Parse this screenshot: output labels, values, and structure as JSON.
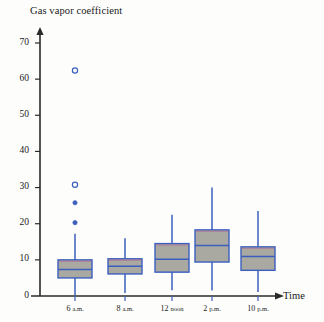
{
  "chart_data": {
    "type": "box",
    "title": "Gas vapor coefficient",
    "xlabel": "Time",
    "ylabel": "Gas vapor coefficient",
    "ylim": [
      0,
      75
    ],
    "yticks": [
      0,
      10,
      20,
      30,
      40,
      50,
      60,
      70
    ],
    "ytick_labels": [
      "0",
      "10",
      "20",
      "30",
      "40",
      "50",
      "60",
      "70"
    ],
    "categories": [
      "6 a.m.",
      "8 a.m.",
      "12 noon",
      "2 p.m.",
      "10 p.m."
    ],
    "grid": false,
    "legend": null,
    "colors": {
      "box_fill": "#a9a9a1",
      "box_outline": "#3c5fbe",
      "median_line": "#3c5fbe",
      "box_top_accent": "#b06a9a",
      "whisker": "#3c5fbe",
      "outlier": "#3c5fbe",
      "axis": "#2a2a2a",
      "background": "#fdfdfc"
    },
    "boxes": [
      {
        "category": "6 a.m.",
        "whisker_low": 0.2,
        "q1": 5.0,
        "median": 7.3,
        "q3": 10.0,
        "whisker_high": 17.2,
        "outliers": [
          {
            "value": 62.4,
            "style": "open"
          },
          {
            "value": 30.8,
            "style": "open"
          },
          {
            "value": 25.8,
            "style": "filled"
          },
          {
            "value": 20.3,
            "style": "filled"
          }
        ]
      },
      {
        "category": "8 a.m.",
        "whisker_low": 0.8,
        "q1": 6.1,
        "median": 8.2,
        "q3": 10.3,
        "whisker_high": 16.0,
        "outliers": []
      },
      {
        "category": "12 noon",
        "whisker_low": 1.6,
        "q1": 6.6,
        "median": 10.2,
        "q3": 14.5,
        "whisker_high": 22.5,
        "outliers": []
      },
      {
        "category": "2 p.m.",
        "whisker_low": 1.5,
        "q1": 9.4,
        "median": 14.0,
        "q3": 18.3,
        "whisker_high": 30.0,
        "outliers": []
      },
      {
        "category": "10 p.m.",
        "whisker_low": 1.1,
        "q1": 7.1,
        "median": 10.9,
        "q3": 13.6,
        "whisker_high": 23.5,
        "outliers": []
      }
    ]
  }
}
